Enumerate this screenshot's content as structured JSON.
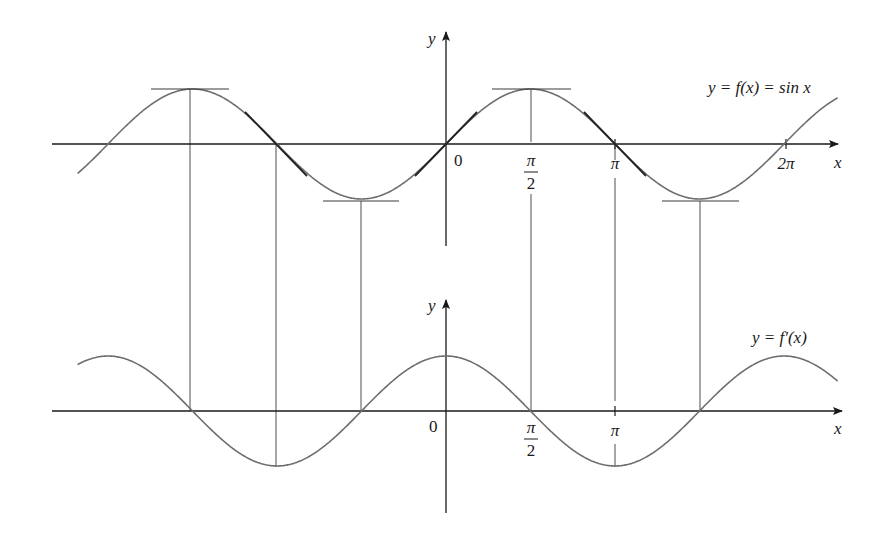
{
  "figure": {
    "top_graph": {
      "curve_label": "y = f(x) = sin x",
      "y_axis_label": "y",
      "x_axis_label": "x",
      "origin_label": "0",
      "ticks": [
        {
          "num": "π",
          "den": "2"
        },
        {
          "num": "π",
          "den": ""
        },
        {
          "num": "2π",
          "den": ""
        }
      ]
    },
    "bottom_graph": {
      "curve_label": "y = f′(x)",
      "y_axis_label": "y",
      "x_axis_label": "x",
      "origin_label": "0",
      "ticks": [
        {
          "num": "π",
          "den": "2"
        },
        {
          "num": "π",
          "den": ""
        }
      ]
    }
  },
  "chart_data": [
    {
      "type": "line",
      "title": "y = f(x) = sin x",
      "xlabel": "x",
      "ylabel": "y",
      "x_range": [
        -2.18,
        2.32
      ],
      "x_unit": "π",
      "ylim": [
        -1,
        1
      ],
      "tick_labels": [
        "0",
        "π/2",
        "π",
        "2π"
      ],
      "series": [
        {
          "name": "f(x) = sin x",
          "function": "sin(x)"
        }
      ],
      "annotations": [
        "horizontal tangent lines at maxima x = -3π/2, π/2",
        "horizontal tangent lines at minima x = -π/2, 3π/2",
        "slope tangent segments at x = -π, 0, π"
      ],
      "grid": false
    },
    {
      "type": "line",
      "title": "y = f′(x)",
      "xlabel": "x",
      "ylabel": "y",
      "x_range": [
        -2.18,
        2.32
      ],
      "x_unit": "π",
      "ylim": [
        -1,
        1
      ],
      "tick_labels": [
        "0",
        "π/2",
        "π"
      ],
      "series": [
        {
          "name": "f′(x) = cos x",
          "function": "cos(x)"
        }
      ],
      "annotations": [
        "vertical guide lines connecting critical points of f to zeros/extrema of f′ at x = -3π/2, -π, -π/2, π/2, π, 3π/2"
      ],
      "grid": false
    }
  ]
}
